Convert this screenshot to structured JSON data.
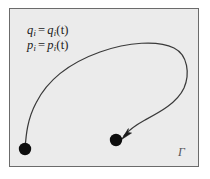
{
  "figure": {
    "type": "phase-space-trajectory-diagram",
    "background_color": "#ffffff",
    "box": {
      "fill_color": "#ebebeb",
      "border_color": "#6b6b6b"
    },
    "labels": {
      "equation_q": {
        "variable": "q",
        "subscript": "i",
        "equals": "=",
        "function": "q",
        "function_subscript": "i",
        "argument": "(t)",
        "full_text": "qᵢ = qᵢ(t)"
      },
      "equation_p": {
        "variable": "p",
        "subscript": "i",
        "equals": "=",
        "function": "p",
        "function_subscript": "i",
        "argument": "(t)",
        "full_text": "pᵢ = pᵢ(t)"
      },
      "space_symbol": "Γ"
    },
    "trajectory": {
      "stroke_color": "#3a3a3a",
      "stroke_width": 1.2,
      "start_point": {
        "x": 25,
        "y": 149,
        "marker": "filled-circle",
        "radius": 6
      },
      "end_point": {
        "x": 116,
        "y": 140,
        "marker": "filled-circle",
        "radius": 6
      },
      "arrowhead": {
        "x": 124,
        "y": 136,
        "direction": "pointing-left-down"
      },
      "path": "M 25 149 C 26 136 27 120 36 103 C 48 79 72 62 100 52 C 128 42 158 40 174 48 C 188 55 190 74 184 88 C 177 103 160 112 145 120 C 134 126 128 131 124 136"
    },
    "marker_color": "#0d0d0d"
  }
}
